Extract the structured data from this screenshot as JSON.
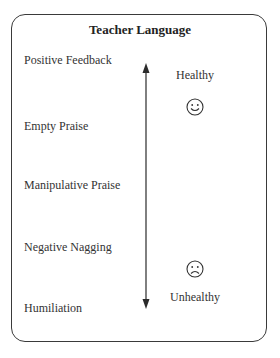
{
  "title": "Teacher Language",
  "items": [
    {
      "label": "Positive Feedback"
    },
    {
      "label": "Empty Praise"
    },
    {
      "label": "Manipulative Praise"
    },
    {
      "label": "Negative Nagging"
    },
    {
      "label": "Humiliation"
    }
  ],
  "scale": {
    "top_label": "Healthy",
    "bottom_label": "Unhealthy",
    "top_icon": "smiley-face-icon",
    "bottom_icon": "frowning-face-icon",
    "direction": "bidirectional-vertical-arrow"
  },
  "colors": {
    "stroke": "#3a3a3a",
    "text": "#333333",
    "background": "#ffffff"
  }
}
